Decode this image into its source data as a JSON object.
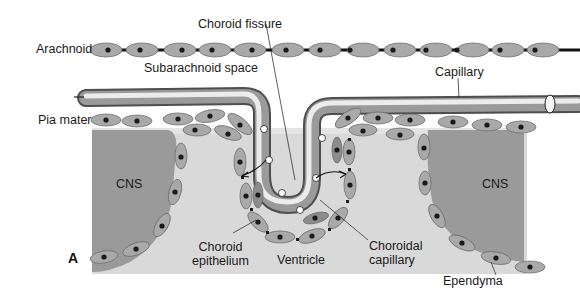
{
  "figure": {
    "panel_letter": "A",
    "labels": {
      "choroid_fissure": "Choroid fissure",
      "arachnoid": "Arachnoid",
      "subarachnoid_space": "Subarachnoid space",
      "capillary": "Capillary",
      "pia_mater": "Pia mater",
      "cns_left": "CNS",
      "cns_right": "CNS",
      "choroid_epithelium_line1": "Choroid",
      "choroid_epithelium_line2": "epithelium",
      "ventricle": "Ventricle",
      "choroidal_capillary_line1": "Choroidal",
      "choroidal_capillary_line2": "capillary",
      "ependyma": "Ependyma"
    },
    "colors": {
      "cell_fill": "#a9a9a9",
      "cell_stroke": "#6e6e6e",
      "nucleus": "#1a1a1a",
      "cns_tissue": "#9a9a9a",
      "ventricle_space": "#d9d9d9",
      "capillary_light": "#e6e6e6",
      "capillary_dark": "#5a5a5a"
    }
  }
}
